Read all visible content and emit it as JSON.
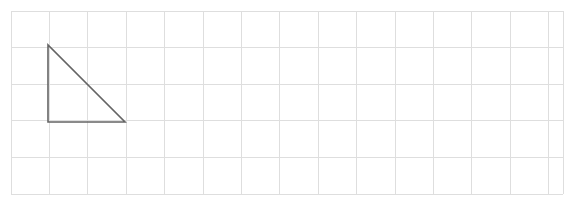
{
  "canvas": {
    "width": 569,
    "height": 205,
    "background_color": "#ffffff"
  },
  "grid": {
    "line_color": "#dedede",
    "line_width": 1,
    "origin_x": 11,
    "origin_y": 11,
    "cell_width": 38.4,
    "cell_height": 36.6,
    "columns": 14,
    "rows": 5,
    "vertical_line_x": [
      11,
      49.4,
      87.8,
      126.2,
      164.6,
      203,
      241.4,
      279.8,
      318.2,
      356.6,
      395,
      433.4,
      471.8,
      510.2,
      548.6,
      563
    ],
    "horizontal_line_y": [
      11,
      47.6,
      84.2,
      120.8,
      157.4,
      194
    ]
  },
  "shapes": [
    {
      "name": "right-triangle",
      "type": "polygon",
      "stroke_color": "#646464",
      "stroke_width": 1.6,
      "fill": "none",
      "vertices": [
        {
          "label": "apex",
          "x": 48,
          "y": 45
        },
        {
          "label": "right-angle",
          "x": 48,
          "y": 122
        },
        {
          "label": "bottom-right",
          "x": 125,
          "y": 122
        }
      ],
      "points_attr": "48,45 48,122 125,122",
      "width_cells": 2,
      "height_cells": 2
    }
  ],
  "chart_data": {
    "type": "scatter",
    "title": "",
    "xlabel": "",
    "ylabel": "",
    "grid": true,
    "legend": "none",
    "xlim": [
      11,
      563
    ],
    "ylim": [
      11,
      194
    ],
    "series": [
      {
        "name": "right-triangle",
        "closed": true,
        "x": [
          48,
          48,
          125,
          48
        ],
        "y": [
          45,
          122,
          122,
          45
        ]
      }
    ],
    "annotations": []
  }
}
